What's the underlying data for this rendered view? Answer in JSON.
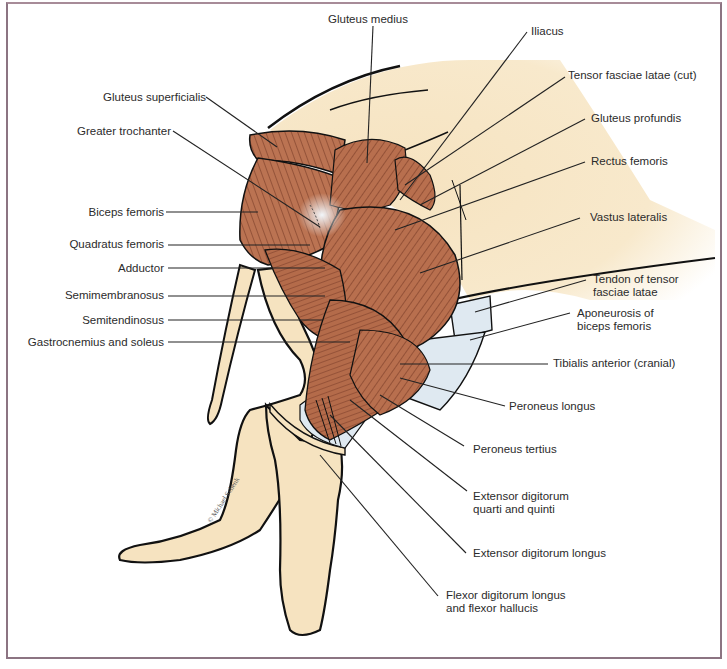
{
  "figure": {
    "credit": "© Michael Schenk",
    "colors": {
      "muscle": "#b86f4e",
      "muscle_stripe": "#6e3220",
      "skin": "#f6e3c0",
      "fascia": "#dfe9f1",
      "outline": "#111111",
      "frame": "#8c7482",
      "leader": "#222222",
      "text": "#2b2b2b"
    }
  },
  "labels": {
    "left": [
      {
        "id": "gluteus-superficialis",
        "text": "Gluteus superficialis"
      },
      {
        "id": "greater-trochanter",
        "text": "Greater trochanter"
      },
      {
        "id": "biceps-femoris",
        "text": "Biceps femoris"
      },
      {
        "id": "quadratus-femoris",
        "text": "Quadratus femoris"
      },
      {
        "id": "adductor",
        "text": "Adductor"
      },
      {
        "id": "semimembranosus",
        "text": "Semimembranosus"
      },
      {
        "id": "semitendinosus",
        "text": "Semitendinosus"
      },
      {
        "id": "gastrocnemius-soleus",
        "text": "Gastrocnemius and soleus"
      }
    ],
    "top": [
      {
        "id": "gluteus-medius",
        "text": "Gluteus medius"
      },
      {
        "id": "iliacus",
        "text": "Iliacus"
      }
    ],
    "right": [
      {
        "id": "tensor-fasciae-latae-cut",
        "text": "Tensor fasciae latae (cut)"
      },
      {
        "id": "gluteus-profundis",
        "text": "Gluteus profundis"
      },
      {
        "id": "rectus-femoris",
        "text": "Rectus femoris"
      },
      {
        "id": "vastus-lateralis",
        "text": "Vastus lateralis"
      },
      {
        "id": "tendon-tensor",
        "line1": "Tendon of tensor",
        "line2": "fasciae latae"
      },
      {
        "id": "aponeurosis-biceps",
        "line1": "Aponeurosis of",
        "line2": "biceps femoris"
      },
      {
        "id": "tibialis-anterior",
        "text": "Tibialis anterior (cranial)"
      },
      {
        "id": "peroneus-longus",
        "text": "Peroneus longus"
      },
      {
        "id": "peroneus-tertius",
        "text": "Peroneus tertius"
      },
      {
        "id": "extensor-dig-quarti",
        "line1": "Extensor digitorum",
        "line2": "quarti and quinti"
      },
      {
        "id": "extensor-dig-longus",
        "text": "Extensor digitorum longus"
      },
      {
        "id": "flexor-dig-longus",
        "line1": "Flexor digitorum longus",
        "line2": "and flexor hallucis"
      }
    ]
  }
}
